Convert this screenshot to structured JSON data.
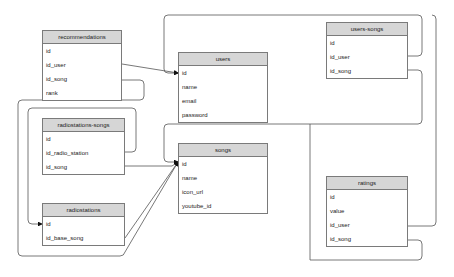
{
  "diagram": {
    "type": "entity-relationship",
    "tables": [
      {
        "key": "recommendations",
        "title": "recommendations",
        "fields": [
          "id",
          "id_user",
          "id_song",
          "rank"
        ],
        "x": 42,
        "y": 30,
        "w": 80
      },
      {
        "key": "users",
        "title": "users",
        "fields": [
          "id",
          "name",
          "email",
          "password"
        ],
        "x": 178,
        "y": 52,
        "w": 90
      },
      {
        "key": "users_songs",
        "title": "users-songs",
        "fields": [
          "id",
          "id_user",
          "id_song"
        ],
        "x": 326,
        "y": 22,
        "w": 82
      },
      {
        "key": "radiostations_songs",
        "title": "radiostations-songs",
        "fields": [
          "id",
          "id_radio_station",
          "id_song"
        ],
        "x": 42,
        "y": 118,
        "w": 83
      },
      {
        "key": "songs",
        "title": "songs",
        "fields": [
          "id",
          "name",
          "icon_url",
          "youtube_id"
        ],
        "x": 178,
        "y": 143,
        "w": 90
      },
      {
        "key": "radiostations",
        "title": "radiostations",
        "fields": [
          "id",
          "id_base_song"
        ],
        "x": 42,
        "y": 203,
        "w": 83
      },
      {
        "key": "ratings",
        "title": "ratings",
        "fields": [
          "id",
          "value",
          "id_user",
          "id_song"
        ],
        "x": 326,
        "y": 176,
        "w": 82
      }
    ],
    "relationships": [
      {
        "from": "recommendations.id_user",
        "to": "users.id"
      },
      {
        "from": "recommendations.id_song",
        "to": "songs.id"
      },
      {
        "from": "users_songs.id_user",
        "to": "users.id"
      },
      {
        "from": "users_songs.id_song",
        "to": "songs.id"
      },
      {
        "from": "radiostations_songs.id_radio_station",
        "to": "radiostations.id"
      },
      {
        "from": "radiostations_songs.id_song",
        "to": "songs.id"
      },
      {
        "from": "radiostations.id_base_song",
        "to": "songs.id"
      },
      {
        "from": "ratings.id_user",
        "to": "users.id"
      },
      {
        "from": "ratings.id_song",
        "to": "songs.id"
      }
    ],
    "colors": {
      "header_bg": "#d6d6d6",
      "border": "#7a7a7a",
      "line": "#555555"
    }
  }
}
